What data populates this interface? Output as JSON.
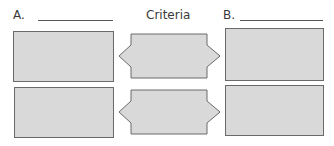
{
  "header": {
    "label_a": "A.",
    "criteria": "Criteria",
    "label_b": "B."
  },
  "colors": {
    "box_fill": "#d9d9d9",
    "box_border": "#6a6a6a",
    "text": "#3a3a3a"
  },
  "rows": [
    {
      "left_box": "",
      "criteria_box": "",
      "right_box": ""
    },
    {
      "left_box": "",
      "criteria_box": "",
      "right_box": ""
    }
  ]
}
